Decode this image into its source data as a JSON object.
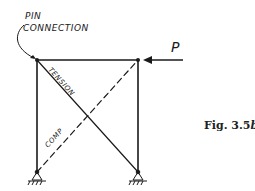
{
  "diagram": {
    "annotation": {
      "line1": "PIN",
      "line2": "CONNECTION"
    },
    "load": {
      "label": "P",
      "direction": "left"
    },
    "members": {
      "diagonal_solid_label": "TENSION",
      "diagonal_dashed_label": "COMP"
    },
    "supports": [
      "pin-support-left",
      "pin-support-right"
    ],
    "caption": {
      "prefix": "Fig. 3.5",
      "suffix": "b"
    },
    "colors": {
      "ink": "#1a1a1a",
      "background": "#ffffff"
    }
  }
}
